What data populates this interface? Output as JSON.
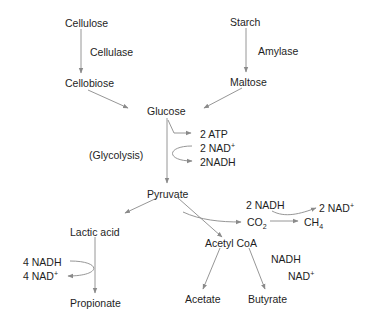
{
  "diagram": {
    "type": "metabolic-pathway",
    "nodes": {
      "cellulose": "Cellulose",
      "starch": "Starch",
      "cellobiose": "Cellobiose",
      "maltose": "Maltose",
      "glucose": "Glucose",
      "pyruvate": "Pyruvate",
      "lactic_acid": "Lactic acid",
      "propionate": "Propionate",
      "acetyl_coa": "Acetyl CoA",
      "acetate": "Acetate",
      "butyrate": "Butyrate",
      "co2": "CO",
      "co2_sub": "2",
      "ch4": "CH",
      "ch4_sub": "4"
    },
    "enzymes": {
      "cellulase": "Cellulase",
      "amylase": "Amylase"
    },
    "process_labels": {
      "glycolysis": "(Glycolysis)"
    },
    "cofactors": {
      "glycolysis_atp": "2 ATP",
      "glycolysis_nad": "2 NAD",
      "glycolysis_nadh": "2NADH",
      "methane_nadh": "2 NADH",
      "methane_nad": "2 NAD",
      "butyrate_nadh": "NADH",
      "butyrate_nad": "NAD",
      "propionate_nadh": "4 NADH",
      "propionate_nad": "4 NAD",
      "plus": "+"
    },
    "edges": [
      {
        "from": "Cellulose",
        "to": "Cellobiose",
        "label": "Cellulase"
      },
      {
        "from": "Starch",
        "to": "Maltose",
        "label": "Amylase"
      },
      {
        "from": "Cellobiose",
        "to": "Glucose"
      },
      {
        "from": "Maltose",
        "to": "Glucose"
      },
      {
        "from": "Glucose",
        "to": "Pyruvate",
        "label": "(Glycolysis)"
      },
      {
        "from": "Glucose",
        "to": "2 ATP"
      },
      {
        "from": "2 NAD+",
        "to": "2NADH"
      },
      {
        "from": "Pyruvate",
        "to": "Lactic acid"
      },
      {
        "from": "Pyruvate",
        "to": "Acetyl CoA"
      },
      {
        "from": "Pyruvate",
        "to": "CO2"
      },
      {
        "from": "CO2",
        "to": "CH4"
      },
      {
        "from": "2 NADH",
        "to": "2 NAD+"
      },
      {
        "from": "Lactic acid",
        "to": "Propionate"
      },
      {
        "from": "4 NADH",
        "to": "4 NAD+"
      },
      {
        "from": "Acetyl CoA",
        "to": "Acetate"
      },
      {
        "from": "Acetyl CoA",
        "to": "Butyrate"
      }
    ],
    "colors": {
      "text": "#1e1e1e",
      "arrow": "#8a8a8a",
      "background": "#ffffff"
    }
  }
}
